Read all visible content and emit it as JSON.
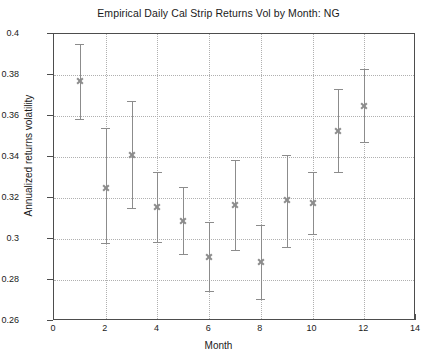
{
  "chart_data": {
    "type": "scatter",
    "title": "Empirical Daily Cal Strip Returns Vol by Month: NG",
    "xlabel": "Month",
    "ylabel": "Annualized returns volatility",
    "xlim": [
      0,
      14
    ],
    "ylim": [
      0.26,
      0.4
    ],
    "xticks": [
      0,
      2,
      4,
      6,
      8,
      10,
      12,
      14
    ],
    "xtick_labels": [
      "0",
      "2",
      "4",
      "6",
      "8",
      "10",
      "12",
      "14"
    ],
    "yticks": [
      0.26,
      0.28,
      0.3,
      0.32,
      0.34,
      0.36,
      0.38,
      0.4
    ],
    "ytick_labels": [
      "0.26",
      "0.28",
      "0.3",
      "0.32",
      "0.34",
      "0.36",
      "0.38",
      "0.4"
    ],
    "grid": true,
    "grid_style": "dotted",
    "legend": null,
    "marker": "x",
    "series_color": "#8c8c8c",
    "x": [
      1,
      2,
      3,
      4,
      5,
      6,
      7,
      8,
      9,
      10,
      11,
      12
    ],
    "values": [
      0.3772,
      0.3251,
      0.3411,
      0.3156,
      0.309,
      0.2914,
      0.3167,
      0.2886,
      0.3188,
      0.3178,
      0.3528,
      0.365
    ],
    "error_low": [
      0.3584,
      0.2979,
      0.3152,
      0.2984,
      0.2926,
      0.2746,
      0.2948,
      0.2707,
      0.296,
      0.3026,
      0.3325,
      0.3475
    ],
    "error_high": [
      0.3949,
      0.3543,
      0.3671,
      0.3329,
      0.3254,
      0.3082,
      0.3387,
      0.3066,
      0.3411,
      0.3325,
      0.3731,
      0.3827
    ],
    "points": [
      {
        "month": 1,
        "value": 0.3772,
        "low": 0.3584,
        "high": 0.3949
      },
      {
        "month": 2,
        "value": 0.3251,
        "low": 0.2979,
        "high": 0.3543
      },
      {
        "month": 3,
        "value": 0.3411,
        "low": 0.3152,
        "high": 0.3671
      },
      {
        "month": 4,
        "value": 0.3156,
        "low": 0.2984,
        "high": 0.3329
      },
      {
        "month": 5,
        "value": 0.309,
        "low": 0.2926,
        "high": 0.3254
      },
      {
        "month": 6,
        "value": 0.2914,
        "low": 0.2746,
        "high": 0.3082
      },
      {
        "month": 7,
        "value": 0.3167,
        "low": 0.2948,
        "high": 0.3387
      },
      {
        "month": 8,
        "value": 0.2886,
        "low": 0.2707,
        "high": 0.3066
      },
      {
        "month": 9,
        "value": 0.3188,
        "low": 0.296,
        "high": 0.3411
      },
      {
        "month": 10,
        "value": 0.3178,
        "low": 0.3026,
        "high": 0.3325
      },
      {
        "month": 11,
        "value": 0.3528,
        "low": 0.3325,
        "high": 0.3731
      },
      {
        "month": 12,
        "value": 0.365,
        "low": 0.3475,
        "high": 0.3827
      }
    ]
  }
}
